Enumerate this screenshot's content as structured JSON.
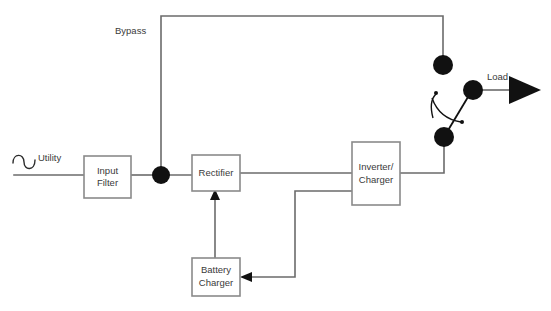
{
  "diagram": {
    "colors": {
      "wire": "#6b6b6b",
      "box_border": "#8a8a8a",
      "node": "#111111",
      "text": "#3a3a3a",
      "background": "#ffffff"
    },
    "blocks": [
      {
        "id": "input-filter",
        "name": "input-filter-block",
        "line1": "Input",
        "line2": "Filter",
        "x": 84,
        "y": 156,
        "w": 47,
        "h": 42
      },
      {
        "id": "rectifier",
        "name": "rectifier-block",
        "line1": "Rectifier",
        "line2": "",
        "x": 192,
        "y": 155,
        "w": 48,
        "h": 36
      },
      {
        "id": "inverter-charger",
        "name": "inverter-charger-block",
        "line1": "Inverter/",
        "line2": "Charger",
        "x": 352,
        "y": 142,
        "w": 48,
        "h": 63
      },
      {
        "id": "battery-charger",
        "name": "battery-charger-block",
        "line1": "Battery",
        "line2": "Charger",
        "x": 192,
        "y": 258,
        "w": 48,
        "h": 38
      }
    ],
    "labels": {
      "utility": "Utility",
      "bypass": "Bypass",
      "load": "Load"
    },
    "nodes": [
      {
        "id": "junction",
        "name": "junction-node",
        "cx": 161,
        "cy": 175,
        "r": 9
      },
      {
        "id": "bypass-contact",
        "name": "bypass-switch-contact-node",
        "cx": 443,
        "cy": 65,
        "r": 10
      },
      {
        "id": "inverter-contact",
        "name": "inverter-switch-contact-node",
        "cx": 444,
        "cy": 137,
        "r": 10
      },
      {
        "id": "load-pole",
        "name": "load-pole-node",
        "cx": 473,
        "cy": 90,
        "r": 10
      }
    ],
    "icons": {
      "sine": "sine-wave-icon",
      "load_arrow": "load-output-arrow-icon",
      "rectifier_arrow": "battery-to-rectifier-arrow-icon",
      "charger_arrow": "inverter-to-charger-arrow-icon",
      "switch": "transfer-switch-icon"
    }
  }
}
